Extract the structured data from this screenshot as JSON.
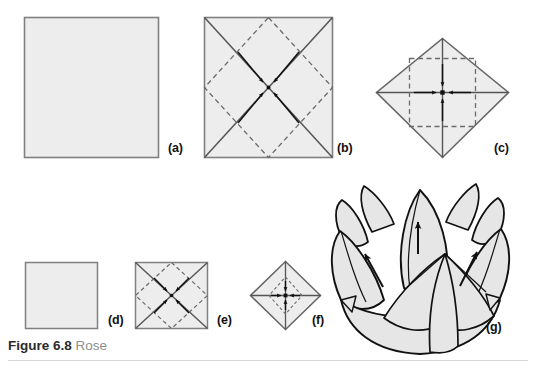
{
  "figure": {
    "caption_number": "Figure 6.8",
    "caption_title": "Rose",
    "panel_count": 7
  },
  "colors": {
    "paper_fill": "#ededed",
    "paper_edge": "#808080",
    "fold_solid": "#555555",
    "fold_dashed": "#6b6b6b",
    "arrow": "#111111",
    "flower_outline": "#111111",
    "flower_fill": "#e6e6e6",
    "caption_number": "#2b2b2b",
    "caption_title": "#8d8d8d",
    "rule": "#d8d8d8",
    "background": "#ffffff"
  },
  "panels": [
    {
      "id": "a",
      "label": "(a)",
      "shape": "square",
      "description": "plain square sheet of paper, coloured side down",
      "label_x": 168,
      "label_y": 141
    },
    {
      "id": "b",
      "label": "(b)",
      "shape": "square-with-diagonals",
      "description": "square creased on both diagonals with dashed mid-edge diamond; four arrows fold corners to centre",
      "label_x": 337,
      "label_y": 141
    },
    {
      "id": "c",
      "label": "(c)",
      "shape": "diamond",
      "description": "diamond with vertical and horizontal creases and dashed inner square; four arrows fold corners to centre",
      "label_x": 494,
      "label_y": 141
    },
    {
      "id": "d",
      "label": "(d)",
      "shape": "square",
      "description": "resulting smaller plain square",
      "label_x": 113,
      "label_y": 318
    },
    {
      "id": "e",
      "label": "(e)",
      "shape": "square-with-diagonals",
      "description": "smaller square creased on diagonals with dashed diamond; four arrows fold corners to centre again",
      "label_x": 222,
      "label_y": 318
    },
    {
      "id": "f",
      "label": "(f)",
      "shape": "diamond",
      "description": "small diamond with cross creases; four arrows fold corners to centre",
      "label_x": 316,
      "label_y": 318
    },
    {
      "id": "g",
      "label": "(g)",
      "shape": "flower",
      "description": "finished rose with petals pulled outward, three arrows showing petal direction",
      "label_x": 488,
      "label_y": 323
    }
  ],
  "arrows": {
    "converge_count_b": 4,
    "converge_count_c": 4,
    "converge_count_e": 4,
    "converge_count_f": 4,
    "petal_pull_count_g": 3
  }
}
